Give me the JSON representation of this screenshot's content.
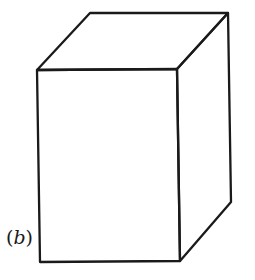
{
  "figure": {
    "label_open": "(",
    "label_letter": "b",
    "label_close": ")",
    "stroke_color": "#1a1a1a",
    "shape": "rectangular-box-perspective"
  }
}
